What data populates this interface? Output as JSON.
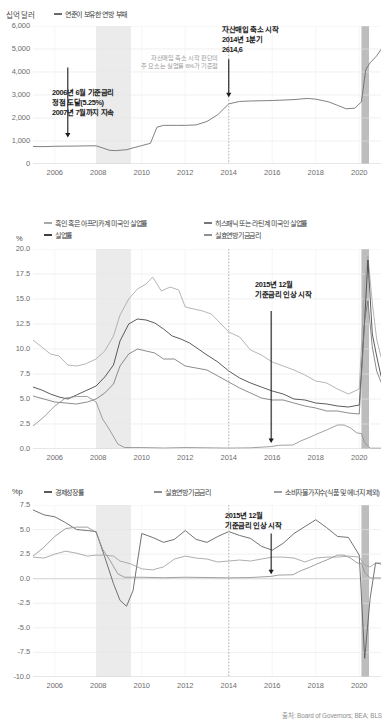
{
  "source_note": "출처: Board of Governors; BEA; BLS",
  "colors": {
    "line_dark": "#4a4a4a",
    "line_mid": "#7a7a7a",
    "line_light": "#a8a8a8",
    "recession_shade": "#ebebeb",
    "covid_shade": "#bdbdbd",
    "reference_line": "#b0b0b0",
    "annotation_text": "#1b1b1b",
    "gray_note": "#9a9a9a",
    "tick_text": "#6d6d6d"
  },
  "panel1": {
    "unit": "십억 달러",
    "legend": [
      {
        "label": "연준이 보유한 연방 부채",
        "color": "#6a6a6a"
      }
    ],
    "annotations": [
      {
        "id": "rate-peak-2006",
        "lines": [
          "2006년 6월 기준금리",
          "정점 도달(5.25%)",
          "2007년 7월까지 지속"
        ]
      },
      {
        "id": "taper-start-2014",
        "lines": [
          "자산매입 축소 시작",
          "2014년 1분기",
          "2614,6"
        ]
      },
      {
        "id": "taper-criteria-note",
        "lines": [
          "자산매입 축소 시작 판단의",
          "주 요소는 실업률 6%가 기준점"
        ]
      }
    ],
    "chart_data": {
      "type": "line",
      "title": "",
      "xlabel": "",
      "ylabel": "십억 달러",
      "ylim": [
        0,
        6000
      ],
      "yticks": [
        "0",
        "1,000",
        "2,000",
        "3,000",
        "4,000",
        "5,000",
        "6,000"
      ],
      "xlim": [
        2005.0,
        2021.0
      ],
      "xticks": [
        "2006",
        "2008",
        "2010",
        "2012",
        "2014",
        "2016",
        "2018",
        "2020"
      ],
      "grid": true,
      "legend_position": "top",
      "shaded_regions": [
        {
          "name": "great-recession",
          "x0": 2007.9,
          "x1": 2009.5,
          "color": "#ebebeb"
        },
        {
          "name": "covid-recession",
          "x0": 2020.1,
          "x1": 2020.45,
          "color": "#bdbdbd"
        }
      ],
      "reference_lines": [
        {
          "name": "2014-q1-marker",
          "x": 2014.0,
          "style": "dotted",
          "color": "#b0b0b0"
        }
      ],
      "series": [
        {
          "name": "연준이 보유한 연방 부채",
          "color": "#6a6a6a",
          "x": [
            2005.0,
            2005.5,
            2006.0,
            2006.5,
            2007.0,
            2007.5,
            2007.9,
            2008.2,
            2008.5,
            2008.8,
            2009.0,
            2009.3,
            2009.6,
            2010.0,
            2010.4,
            2010.7,
            2011.0,
            2011.3,
            2011.6,
            2012.0,
            2012.5,
            2013.0,
            2013.5,
            2014.0,
            2014.5,
            2015.0,
            2016.0,
            2017.0,
            2017.6,
            2018.0,
            2018.6,
            2019.0,
            2019.4,
            2019.8,
            2020.1,
            2020.3,
            2020.5,
            2020.8,
            2021.0
          ],
          "values": [
            760,
            755,
            770,
            775,
            780,
            790,
            790,
            700,
            600,
            580,
            600,
            620,
            700,
            800,
            900,
            1600,
            1680,
            1680,
            1680,
            1680,
            1700,
            1850,
            2150,
            2614.6,
            2720,
            2740,
            2760,
            2800,
            2850,
            2820,
            2700,
            2550,
            2400,
            2430,
            2700,
            4100,
            4400,
            4700,
            4980
          ]
        }
      ]
    }
  },
  "panel2": {
    "unit": "%",
    "legend": [
      {
        "label": "흑인 혹은 아프리카계 미국인 실업률",
        "color": "#a8a8a8"
      },
      {
        "label": "실업률",
        "color": "#777777"
      },
      {
        "label": "히스패닉 또는 라틴계 미국인 실업률",
        "color": "#3f3f3f"
      },
      {
        "label": "실효연방기금금리",
        "color": "#8f8f8f"
      }
    ],
    "annotations": [
      {
        "id": "rate-hike-start-2015",
        "lines": [
          "2015년 12월",
          "기준금리 인상 시작"
        ]
      }
    ],
    "chart_data": {
      "type": "line",
      "title": "",
      "xlabel": "",
      "ylabel": "%",
      "ylim": [
        0.0,
        20.0
      ],
      "yticks": [
        "0.0",
        "2.5",
        "5.0",
        "7.5",
        "10.0",
        "12.5",
        "15.0",
        "17.5",
        "20.0"
      ],
      "xlim": [
        2005.0,
        2021.0
      ],
      "xticks": [
        "2006",
        "2008",
        "2010",
        "2012",
        "2014",
        "2016",
        "2018",
        "2020"
      ],
      "grid": true,
      "legend_position": "top",
      "shaded_regions": [
        {
          "name": "great-recession",
          "x0": 2007.9,
          "x1": 2009.5,
          "color": "#ebebeb"
        },
        {
          "name": "covid-recession",
          "x0": 2020.1,
          "x1": 2020.45,
          "color": "#bdbdbd"
        }
      ],
      "reference_lines": [
        {
          "name": "2014-q1-marker",
          "x": 2014.0,
          "style": "dotted",
          "color": "#b0b0b0"
        }
      ],
      "series": [
        {
          "name": "흑인 혹은 아프리카계 미국인 실업률",
          "color": "#a8a8a8",
          "x": [
            2005.0,
            2005.4,
            2005.8,
            2006.2,
            2006.6,
            2007.0,
            2007.4,
            2007.9,
            2008.3,
            2008.7,
            2009.0,
            2009.4,
            2009.8,
            2010.2,
            2010.5,
            2010.9,
            2011.3,
            2011.7,
            2012.0,
            2012.4,
            2012.8,
            2013.2,
            2013.6,
            2014.0,
            2014.5,
            2015.0,
            2015.5,
            2016.0,
            2016.5,
            2017.0,
            2017.5,
            2018.0,
            2018.5,
            2019.0,
            2019.5,
            2020.0,
            2020.25,
            2020.4,
            2020.6,
            2020.8,
            2021.0
          ],
          "values": [
            10.9,
            10.2,
            9.5,
            9.3,
            8.4,
            8.3,
            8.5,
            9.0,
            9.8,
            11.3,
            13.4,
            15.0,
            16.0,
            16.5,
            17.2,
            15.8,
            16.2,
            15.9,
            14.2,
            14.0,
            13.8,
            13.5,
            12.6,
            11.7,
            11.2,
            9.9,
            9.4,
            8.7,
            8.3,
            7.9,
            7.4,
            6.8,
            6.6,
            6.0,
            5.5,
            6.0,
            16.7,
            19.3,
            14.6,
            11.0,
            9.2
          ]
        },
        {
          "name": "히스패닉 또는 라틴계 미국인 실업률",
          "color": "#3f3f3f",
          "x": [
            2005.0,
            2005.4,
            2005.8,
            2006.2,
            2006.6,
            2007.0,
            2007.4,
            2007.9,
            2008.3,
            2008.7,
            2009.0,
            2009.4,
            2009.8,
            2010.2,
            2010.6,
            2011.0,
            2011.4,
            2011.8,
            2012.2,
            2012.6,
            2013.0,
            2013.5,
            2014.0,
            2014.5,
            2015.0,
            2015.5,
            2016.0,
            2016.5,
            2017.0,
            2017.5,
            2018.0,
            2018.5,
            2019.0,
            2019.5,
            2020.0,
            2020.25,
            2020.4,
            2020.6,
            2020.8,
            2021.0
          ],
          "values": [
            6.2,
            5.9,
            5.5,
            5.2,
            5.0,
            5.4,
            5.8,
            6.3,
            7.2,
            8.4,
            10.8,
            12.5,
            13.0,
            12.9,
            12.6,
            12.0,
            11.3,
            11.0,
            10.6,
            10.0,
            9.4,
            8.7,
            7.8,
            7.1,
            6.6,
            6.2,
            5.8,
            5.5,
            5.0,
            4.9,
            4.6,
            4.5,
            4.3,
            4.2,
            4.4,
            13.0,
            18.9,
            11.5,
            9.3,
            7.3
          ]
        },
        {
          "name": "실업률",
          "color": "#777777",
          "x": [
            2005.0,
            2005.5,
            2006.0,
            2006.5,
            2007.0,
            2007.5,
            2007.9,
            2008.3,
            2008.7,
            2009.0,
            2009.4,
            2009.8,
            2010.2,
            2010.6,
            2011.0,
            2011.5,
            2012.0,
            2012.5,
            2013.0,
            2013.5,
            2014.0,
            2014.5,
            2015.0,
            2015.5,
            2016.0,
            2016.5,
            2017.0,
            2017.5,
            2018.0,
            2018.5,
            2019.0,
            2019.5,
            2020.0,
            2020.25,
            2020.4,
            2020.6,
            2020.8,
            2021.0
          ],
          "values": [
            5.3,
            5.0,
            4.7,
            4.6,
            4.5,
            4.7,
            5.0,
            5.6,
            6.5,
            8.3,
            9.5,
            10.0,
            9.8,
            9.6,
            9.0,
            9.0,
            8.3,
            8.1,
            7.9,
            7.3,
            6.7,
            6.1,
            5.6,
            5.1,
            4.9,
            4.9,
            4.6,
            4.3,
            4.1,
            3.8,
            3.8,
            3.6,
            3.5,
            13.0,
            14.8,
            10.2,
            7.8,
            6.7
          ]
        },
        {
          "name": "실효연방기금금리",
          "color": "#8f8f8f",
          "x": [
            2005.0,
            2005.5,
            2006.0,
            2006.5,
            2007.0,
            2007.5,
            2007.9,
            2008.2,
            2008.5,
            2008.9,
            2009.2,
            2009.6,
            2010.0,
            2011.0,
            2012.0,
            2013.0,
            2014.0,
            2015.0,
            2015.95,
            2016.3,
            2016.95,
            2017.3,
            2017.7,
            2018.0,
            2018.5,
            2019.0,
            2019.3,
            2019.6,
            2019.9,
            2020.1,
            2020.25,
            2020.5,
            2021.0
          ],
          "values": [
            2.3,
            3.2,
            4.3,
            5.1,
            5.25,
            5.25,
            4.7,
            3.0,
            2.0,
            0.5,
            0.15,
            0.15,
            0.15,
            0.1,
            0.15,
            0.12,
            0.09,
            0.12,
            0.24,
            0.37,
            0.4,
            0.8,
            1.15,
            1.45,
            1.9,
            2.4,
            2.4,
            2.1,
            1.6,
            1.55,
            0.65,
            0.08,
            0.08
          ]
        }
      ]
    }
  },
  "panel3": {
    "unit": "%p",
    "legend": [
      {
        "label": "경제성장률",
        "color": "#5a5a5a"
      },
      {
        "label": "실효연방기금금리",
        "color": "#8f8f8f"
      },
      {
        "label": "소비자물가지수(식품 및 에너지 제외)",
        "color": "#9f9f9f"
      }
    ],
    "annotations": [
      {
        "id": "rate-hike-start-2015",
        "lines": [
          "2015년 12월",
          "기준금리 인상 시작"
        ]
      }
    ],
    "chart_data": {
      "type": "line",
      "title": "",
      "xlabel": "",
      "ylabel": "%p",
      "ylim": [
        -10.0,
        7.5
      ],
      "yticks": [
        "-10.0",
        "-7.5",
        "-5.0",
        "-2.5",
        "0.0",
        "2.5",
        "5.0",
        "7.5"
      ],
      "xlim": [
        2005.0,
        2021.0
      ],
      "xticks": [
        "2006",
        "2008",
        "2010",
        "2012",
        "2014",
        "2016",
        "2018",
        "2020"
      ],
      "grid": true,
      "legend_position": "top",
      "shaded_regions": [
        {
          "name": "great-recession",
          "x0": 2007.9,
          "x1": 2009.5,
          "color": "#ebebeb"
        },
        {
          "name": "covid-recession",
          "x0": 2020.1,
          "x1": 2020.45,
          "color": "#bdbdbd"
        }
      ],
      "reference_lines": [
        {
          "name": "2014-q1-marker",
          "x": 2014.0,
          "style": "dotted",
          "color": "#b0b0b0"
        }
      ],
      "series": [
        {
          "name": "경제성장률",
          "color": "#5a5a5a",
          "x": [
            2005.0,
            2005.5,
            2006.0,
            2006.5,
            2007.0,
            2007.5,
            2007.9,
            2008.3,
            2008.7,
            2009.0,
            2009.3,
            2009.6,
            2010.0,
            2010.5,
            2011.0,
            2011.5,
            2012.0,
            2012.5,
            2013.0,
            2013.5,
            2014.0,
            2014.5,
            2015.0,
            2015.5,
            2016.0,
            2016.5,
            2017.0,
            2017.5,
            2018.0,
            2018.5,
            2019.0,
            2019.5,
            2020.0,
            2020.25,
            2020.5,
            2020.75,
            2021.0
          ],
          "values": [
            7.0,
            6.5,
            6.3,
            5.7,
            5.0,
            4.9,
            4.8,
            2.2,
            -0.5,
            -2.2,
            -2.8,
            -1.2,
            4.6,
            4.2,
            3.7,
            4.0,
            4.9,
            4.0,
            3.7,
            4.3,
            4.8,
            4.4,
            4.1,
            3.3,
            2.9,
            3.6,
            4.6,
            5.3,
            6.0,
            5.2,
            4.3,
            4.2,
            2.4,
            -8.1,
            -2.0,
            1.6,
            1.5
          ]
        },
        {
          "name": "실효연방기금금리",
          "color": "#8f8f8f",
          "x": [
            2005.0,
            2005.5,
            2006.0,
            2006.5,
            2007.0,
            2007.5,
            2007.9,
            2008.2,
            2008.5,
            2008.9,
            2009.2,
            2009.6,
            2010.0,
            2011.0,
            2012.0,
            2013.0,
            2014.0,
            2015.0,
            2015.95,
            2016.3,
            2016.95,
            2017.3,
            2017.7,
            2018.0,
            2018.5,
            2019.0,
            2019.3,
            2019.6,
            2019.9,
            2020.1,
            2020.25,
            2020.5,
            2021.0
          ],
          "values": [
            2.3,
            3.2,
            4.3,
            5.1,
            5.25,
            5.25,
            4.7,
            3.0,
            2.0,
            0.5,
            0.15,
            0.15,
            0.15,
            0.1,
            0.15,
            0.12,
            0.09,
            0.12,
            0.24,
            0.37,
            0.4,
            0.8,
            1.15,
            1.45,
            1.9,
            2.4,
            2.4,
            2.1,
            1.6,
            1.55,
            0.65,
            0.08,
            0.08
          ]
        },
        {
          "name": "소비자물가지수(식품 및 에너지 제외)",
          "color": "#9f9f9f",
          "x": [
            2005.0,
            2005.5,
            2006.0,
            2006.5,
            2007.0,
            2007.5,
            2007.9,
            2008.3,
            2008.7,
            2009.0,
            2009.5,
            2010.0,
            2010.5,
            2011.0,
            2011.5,
            2012.0,
            2012.5,
            2013.0,
            2013.5,
            2014.0,
            2014.5,
            2015.0,
            2015.5,
            2016.0,
            2016.5,
            2017.0,
            2017.5,
            2018.0,
            2018.5,
            2019.0,
            2019.5,
            2020.0,
            2020.25,
            2020.5,
            2020.75,
            2021.0
          ],
          "values": [
            2.2,
            2.1,
            2.5,
            2.8,
            2.6,
            2.3,
            2.4,
            2.4,
            2.3,
            1.8,
            1.5,
            1.0,
            0.9,
            1.2,
            2.0,
            2.3,
            2.1,
            2.0,
            1.7,
            1.8,
            1.9,
            1.8,
            2.0,
            2.2,
            2.2,
            2.1,
            1.7,
            2.1,
            2.2,
            2.2,
            2.3,
            2.2,
            1.4,
            1.2,
            1.6,
            1.6
          ]
        }
      ]
    }
  }
}
